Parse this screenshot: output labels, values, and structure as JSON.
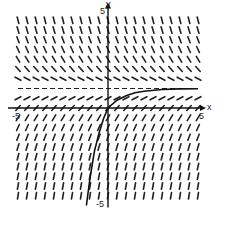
{
  "figure": {
    "type": "slope_field",
    "equation_hint": "dy/dx = 1 - y",
    "x_axis_label": "x",
    "y_axis_label": "y",
    "x_min_label": "-5",
    "x_max_label": "5",
    "y_max_label": "5",
    "y_min_label": "-5",
    "xlim": [
      -5,
      5
    ],
    "ylim": [
      -5,
      5
    ],
    "equilibrium_y": 1,
    "grid_step": 0.5,
    "colors": {
      "ink": "#222222",
      "background": "#ffffff"
    },
    "solution_curve": {
      "description": "solution through origin approaching y = 1",
      "points": [
        [
          -1.2,
          -5
        ],
        [
          -1,
          -3.6
        ],
        [
          -0.75,
          -2.2
        ],
        [
          -0.5,
          -1.3
        ],
        [
          -0.25,
          -0.55
        ],
        [
          0,
          0
        ],
        [
          0.5,
          0.4
        ],
        [
          1,
          0.63
        ],
        [
          1.5,
          0.78
        ],
        [
          2,
          0.86
        ],
        [
          3,
          0.95
        ],
        [
          4,
          0.98
        ],
        [
          5,
          0.99
        ]
      ]
    }
  }
}
